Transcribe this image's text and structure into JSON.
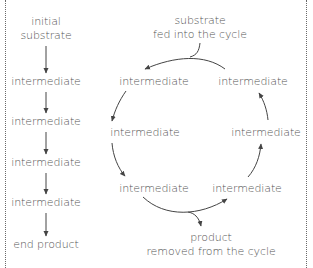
{
  "linear_pathway": {
    "steps": [
      {
        "label_line1": "initial",
        "label_line2": "substrate"
      },
      {
        "label": "intermediate"
      },
      {
        "label": "intermediate"
      },
      {
        "label": "intermediate"
      },
      {
        "label": "intermediate"
      },
      {
        "label": "end product"
      }
    ]
  },
  "cycle": {
    "input_note": {
      "line1": "substrate",
      "line2": "fed into the cycle"
    },
    "output_note": {
      "line1": "product",
      "line2": "removed from the cycle"
    },
    "nodes": [
      {
        "label": "intermediate",
        "position": "top-left"
      },
      {
        "label": "intermediate",
        "position": "left"
      },
      {
        "label": "intermediate",
        "position": "bottom-left"
      },
      {
        "label": "intermediate",
        "position": "bottom-right"
      },
      {
        "label": "intermediate",
        "position": "right"
      },
      {
        "label": "intermediate",
        "position": "top-right"
      }
    ]
  },
  "colors": {
    "text": "#555555",
    "arrow": "#444444",
    "border": "#6a6a6a"
  }
}
